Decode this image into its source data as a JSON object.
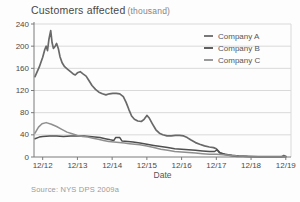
{
  "title": {
    "main": "Customers affected",
    "unit": "(thousand)"
  },
  "source": "Source: NYS DPS 2009a",
  "colors": {
    "grid": "#d9d9d9",
    "axis": "#7a7a7a",
    "tick_label": "#4a4a4a",
    "legend_text": "#565656",
    "axis_title": "#555555"
  },
  "chart_data": {
    "type": "line",
    "xlabel": "Date",
    "ylabel": "Customers affected (thousand)",
    "x_tick_labels": [
      "12/12",
      "12/13",
      "12/14",
      "12/15",
      "12/16",
      "12/17",
      "12/18",
      "12/19"
    ],
    "x_tick_positions": [
      0,
      1,
      2,
      3,
      4,
      5,
      6,
      7
    ],
    "y_ticks": [
      0,
      40,
      80,
      120,
      160,
      200,
      240
    ],
    "ylim": [
      0,
      240
    ],
    "x_range": [
      -0.25,
      7.15
    ],
    "grid": true,
    "legend_position": "top-right",
    "series": [
      {
        "name": "Company A",
        "color": "#696969",
        "width": 1.7,
        "points": [
          [
            -0.22,
            145
          ],
          [
            -0.1,
            162
          ],
          [
            0,
            180
          ],
          [
            0.06,
            194
          ],
          [
            0.1,
            200
          ],
          [
            0.14,
            192
          ],
          [
            0.18,
            212
          ],
          [
            0.23,
            228
          ],
          [
            0.27,
            206
          ],
          [
            0.31,
            196
          ],
          [
            0.36,
            200
          ],
          [
            0.4,
            205
          ],
          [
            0.45,
            196
          ],
          [
            0.5,
            181
          ],
          [
            0.56,
            170
          ],
          [
            0.63,
            163
          ],
          [
            0.72,
            158
          ],
          [
            0.8,
            154
          ],
          [
            0.88,
            150
          ],
          [
            0.94,
            148
          ],
          [
            1.0,
            152
          ],
          [
            1.08,
            154
          ],
          [
            1.16,
            150
          ],
          [
            1.25,
            146
          ],
          [
            1.33,
            138
          ],
          [
            1.42,
            129
          ],
          [
            1.52,
            122
          ],
          [
            1.62,
            117
          ],
          [
            1.72,
            114
          ],
          [
            1.82,
            112
          ],
          [
            1.92,
            114
          ],
          [
            2.02,
            115
          ],
          [
            2.12,
            115
          ],
          [
            2.22,
            114
          ],
          [
            2.32,
            109
          ],
          [
            2.4,
            99
          ],
          [
            2.48,
            86
          ],
          [
            2.56,
            74
          ],
          [
            2.64,
            68
          ],
          [
            2.74,
            65
          ],
          [
            2.84,
            64
          ],
          [
            2.92,
            68
          ],
          [
            3.0,
            75
          ],
          [
            3.06,
            71
          ],
          [
            3.16,
            60
          ],
          [
            3.26,
            49
          ],
          [
            3.36,
            43
          ],
          [
            3.46,
            40
          ],
          [
            3.58,
            38
          ],
          [
            3.7,
            38
          ],
          [
            3.82,
            39
          ],
          [
            3.94,
            39
          ],
          [
            4.06,
            38
          ],
          [
            4.16,
            35
          ],
          [
            4.26,
            31
          ],
          [
            4.4,
            26
          ],
          [
            4.52,
            23
          ],
          [
            4.66,
            20
          ],
          [
            4.8,
            18
          ],
          [
            4.92,
            17
          ],
          [
            5.0,
            15
          ],
          [
            5.09,
            8
          ],
          [
            5.2,
            5
          ],
          [
            5.31,
            4
          ],
          [
            5.45,
            2
          ],
          [
            5.6,
            1
          ],
          [
            5.9,
            1
          ],
          [
            6.2,
            0.5
          ],
          [
            6.6,
            0.5
          ],
          [
            6.88,
            0.5
          ],
          [
            6.94,
            2.5
          ],
          [
            7.0,
            1
          ]
        ]
      },
      {
        "name": "Company B",
        "color": "#4f4f4f",
        "width": 1.5,
        "points": [
          [
            -0.22,
            33
          ],
          [
            -0.1,
            36
          ],
          [
            0,
            37
          ],
          [
            0.2,
            38
          ],
          [
            0.4,
            38
          ],
          [
            0.6,
            37
          ],
          [
            0.8,
            38
          ],
          [
            1.0,
            38
          ],
          [
            1.2,
            38
          ],
          [
            1.35,
            37
          ],
          [
            1.5,
            36
          ],
          [
            1.65,
            35
          ],
          [
            1.8,
            33
          ],
          [
            1.95,
            31
          ],
          [
            2.05,
            30
          ],
          [
            2.1,
            35
          ],
          [
            2.22,
            35
          ],
          [
            2.28,
            29
          ],
          [
            2.45,
            28
          ],
          [
            2.6,
            27
          ],
          [
            2.8,
            25
          ],
          [
            3.0,
            23
          ],
          [
            3.2,
            21
          ],
          [
            3.4,
            19
          ],
          [
            3.6,
            17
          ],
          [
            3.8,
            15
          ],
          [
            4.0,
            14
          ],
          [
            4.2,
            13
          ],
          [
            4.4,
            12
          ],
          [
            4.6,
            11
          ],
          [
            4.8,
            10
          ],
          [
            4.95,
            10
          ],
          [
            5.02,
            13
          ],
          [
            5.1,
            8
          ],
          [
            5.25,
            5
          ],
          [
            5.45,
            3
          ],
          [
            5.65,
            2
          ],
          [
            5.9,
            1
          ],
          [
            6.2,
            0.5
          ],
          [
            7.0,
            0.5
          ]
        ]
      },
      {
        "name": "Company C",
        "color": "#8f8f8f",
        "width": 1.5,
        "points": [
          [
            -0.22,
            43
          ],
          [
            -0.12,
            54
          ],
          [
            -0.02,
            60
          ],
          [
            0.1,
            62
          ],
          [
            0.25,
            59
          ],
          [
            0.4,
            55
          ],
          [
            0.55,
            50
          ],
          [
            0.7,
            45
          ],
          [
            0.85,
            42
          ],
          [
            1.0,
            39
          ],
          [
            1.15,
            37
          ],
          [
            1.3,
            36
          ],
          [
            1.45,
            34
          ],
          [
            1.6,
            32
          ],
          [
            1.75,
            30
          ],
          [
            1.9,
            28
          ],
          [
            2.05,
            27
          ],
          [
            2.2,
            26
          ],
          [
            2.35,
            25
          ],
          [
            2.5,
            24
          ],
          [
            2.65,
            23
          ],
          [
            2.8,
            22
          ],
          [
            3.0,
            20
          ],
          [
            3.2,
            17
          ],
          [
            3.4,
            14
          ],
          [
            3.6,
            12
          ],
          [
            3.8,
            10
          ],
          [
            4.0,
            9
          ],
          [
            4.2,
            8
          ],
          [
            4.4,
            7
          ],
          [
            4.6,
            6
          ],
          [
            4.8,
            5
          ],
          [
            5.0,
            5
          ],
          [
            5.2,
            4
          ],
          [
            5.4,
            3
          ],
          [
            5.6,
            2
          ],
          [
            5.9,
            1
          ],
          [
            6.2,
            0.5
          ],
          [
            7.0,
            0.5
          ]
        ]
      }
    ]
  }
}
